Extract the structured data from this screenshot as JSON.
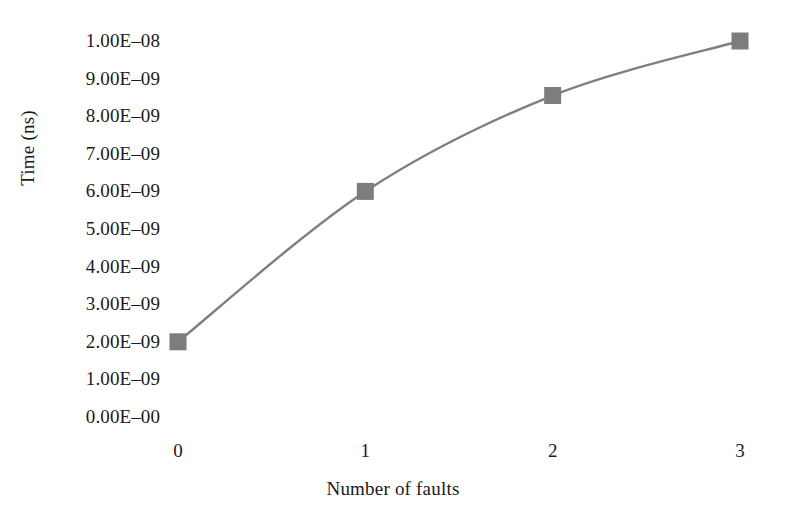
{
  "chart_data": {
    "type": "line",
    "title": "",
    "xlabel": "Number of faults",
    "ylabel": "Time (ns)",
    "x": [
      0,
      1,
      2,
      3
    ],
    "values": [
      2e-09,
      6e-09,
      8.55e-09,
      1e-08
    ],
    "series": [
      {
        "name": "Time",
        "values": [
          2e-09,
          6e-09,
          8.55e-09,
          1e-08
        ]
      }
    ],
    "x_tick_labels": [
      "0",
      "1",
      "2",
      "3"
    ],
    "y_tick_labels": [
      "1.00E–08",
      "9.00E–09",
      "8.00E–09",
      "7.00E–09",
      "6.00E–09",
      "5.00E–09",
      "4.00E–09",
      "3.00E–09",
      "2.00E–09",
      "1.00E–09",
      "0.00E–00"
    ],
    "y_tick_values": [
      1e-08,
      9e-09,
      8e-09,
      7e-09,
      6e-09,
      5e-09,
      4e-09,
      3e-09,
      2e-09,
      1e-09,
      0
    ],
    "xlim": [
      0,
      3
    ],
    "ylim": [
      0,
      1e-08
    ],
    "grid": false,
    "legend": "none",
    "marker": "square",
    "line_smoothing": true,
    "colors": {
      "line": "#7f7f7f",
      "marker": "#7d7d7d",
      "background": "#ffffff",
      "text": "#1a1a1a"
    }
  },
  "labels": {
    "y_axis_title": "Time (ns)",
    "x_axis_title": "Number of faults"
  }
}
